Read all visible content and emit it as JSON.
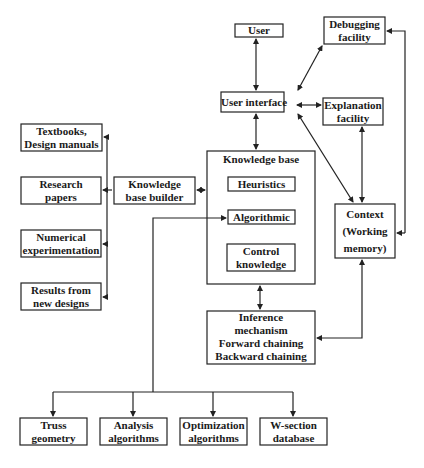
{
  "nodes": {
    "user": "User",
    "debugging": [
      "Debugging",
      "facility"
    ],
    "user_interface": "User interface",
    "explanation": [
      "Explanation",
      "facility"
    ],
    "textbooks": [
      "Textbooks,",
      "Design manuals"
    ],
    "research": [
      "Research",
      "papers"
    ],
    "numerical": [
      "Numerical",
      "experimentation"
    ],
    "results": [
      "Results from",
      "new designs"
    ],
    "kb_builder": [
      "Knowledge",
      "base builder"
    ],
    "knowledge_base": "Knowledge base",
    "heuristics": "Heuristics",
    "algorithmic": "Algorithmic",
    "control": [
      "Control",
      "knowledge"
    ],
    "context": [
      "Context",
      "(Working",
      "memory)"
    ],
    "inference": [
      "Inference",
      "mechanism",
      "Forward chaining",
      "Backward chaining"
    ],
    "truss": [
      "Truss",
      "geometry"
    ],
    "analysis": [
      "Analysis",
      "algorithms"
    ],
    "optimization": [
      "Optimization",
      "algorithms"
    ],
    "wsection": [
      "W-section",
      "database"
    ]
  }
}
